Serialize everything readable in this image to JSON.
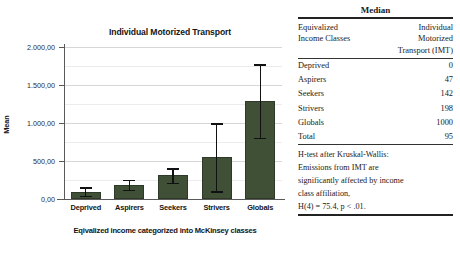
{
  "figure": {
    "caption_faint": "",
    "chart_data": {
      "type": "bar",
      "title": "Individual Motorized Transport",
      "xlabel": "Eqivalized income categorized into McKinsey classes",
      "ylabel": "Mean",
      "categories": [
        "Deprived",
        "Aspirers",
        "Seekers",
        "Strivers",
        "Globals"
      ],
      "values": [
        95,
        190,
        310,
        548,
        1288
      ],
      "error_low": [
        40,
        118,
        212,
        103,
        808
      ],
      "error_high": [
        152,
        250,
        403,
        995,
        1772
      ],
      "ylim": [
        0,
        2100
      ],
      "ytick_values": [
        0,
        500,
        1000,
        1500,
        2000
      ],
      "ytick_labels": [
        "0,00",
        "500,00",
        "1.000,00",
        "1.500,00",
        "2.000,00"
      ],
      "grid": true,
      "legend": "none",
      "bar_color": "#3f5037",
      "error_color": "#111111",
      "error_note": "95% CI error bars"
    }
  },
  "table": {
    "header": "Median",
    "column_header_left": [
      "Equivalized",
      "Income Classes"
    ],
    "column_header_right": [
      "Individual",
      "Motorized",
      "Transport (IMT)"
    ],
    "rows": [
      {
        "label": "Deprived",
        "value": "0"
      },
      {
        "label": "Aspirers",
        "value": "47"
      },
      {
        "label": "Seekers",
        "value": "142"
      },
      {
        "label": "Strivers",
        "value": "198"
      },
      {
        "label": "Globals",
        "value": "1000"
      },
      {
        "label": "Total",
        "value": "95"
      }
    ],
    "note_lines": [
      "H-test after Kruskal-Wallis:",
      "Emissions from IMT are",
      "significantly affected by income",
      "class affiliation,",
      "H(4) = 75.4, p < .01."
    ]
  }
}
